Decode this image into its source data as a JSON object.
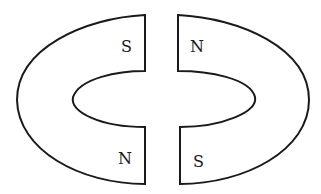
{
  "diagram": {
    "type": "two horseshoe magnets facing each other",
    "left_magnet": {
      "top_pole": "S",
      "bottom_pole": "N"
    },
    "right_magnet": {
      "top_pole": "N",
      "bottom_pole": "S"
    },
    "stroke_color": "#1a1a1a",
    "fill_color": "#ffffff"
  }
}
